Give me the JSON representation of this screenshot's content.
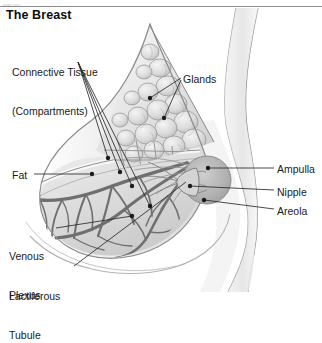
{
  "page": {
    "faint_header": "ANATOMY",
    "title": "The Breast"
  },
  "labels": {
    "connective_tissue_line1": "Connective Tissue",
    "connective_tissue_line2": "(Compartments)",
    "glands": "Glands",
    "fat": "Fat",
    "venous_line1": "Venous",
    "venous_line2": "Plexus",
    "lactiferous_line1": "Lactiferous",
    "lactiferous_line2": "Tubule",
    "ampulla": "Ampulla",
    "nipple": "Nipple",
    "areola": "Areola"
  },
  "colors": {
    "background": "#ffffff",
    "text": "#1a1a1a",
    "rule": "#8d8d8d",
    "leader": "#2b2b2b",
    "tissue_light": "#e9e9e9",
    "tissue_mid": "#cfcfcf",
    "tissue_dark": "#9a9a9a",
    "vein": "#6e6e6e",
    "areola": "#b6b6b6",
    "skin_outline": "#8a8a8a"
  },
  "diagram": {
    "view": "sagittal cross-section of the female breast against the chest wall",
    "structures": [
      "glandular lobules",
      "connective tissue compartments",
      "subcutaneous fat",
      "venous plexus",
      "lactiferous tubules",
      "ampulla",
      "nipple",
      "areola"
    ]
  }
}
